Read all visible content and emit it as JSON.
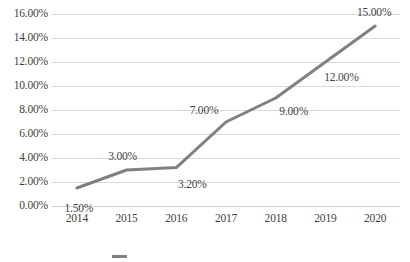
{
  "chart_data": {
    "type": "line",
    "title": "",
    "subtitle": "",
    "xlabel": "",
    "ylabel": "",
    "categories": [
      "2014",
      "2015",
      "2016",
      "2017",
      "2018",
      "2019",
      "2020"
    ],
    "values": [
      1.5,
      3.0,
      3.2,
      7.0,
      9.0,
      12.0,
      15.0
    ],
    "point_labels": [
      "1.50%",
      "3.00%",
      "3.20%",
      "7.00%",
      "9.00%",
      "12.00%",
      "15.00%"
    ],
    "ylim": [
      0,
      16
    ],
    "ytick_values": [
      0,
      2,
      4,
      6,
      8,
      10,
      12,
      14,
      16
    ],
    "ytick_labels": [
      "0.00%",
      "2.00%",
      "4.00%",
      "6.00%",
      "8.00%",
      "10.00%",
      "12.00%",
      "14.00%",
      "16.00%"
    ],
    "grid": true,
    "grid_axis": "y",
    "legend_position": "bottom",
    "series": [
      {
        "name": "",
        "color": "#808080",
        "values": [
          1.5,
          3.0,
          3.2,
          7.0,
          9.0,
          12.0,
          15.0
        ]
      }
    ],
    "colors": {
      "line": "#808080",
      "gridline": "#d9d9d9",
      "text": "#3f3f3f",
      "background": "#ffffff"
    }
  },
  "legend": {
    "swatch_color": "#808080",
    "label": ""
  }
}
